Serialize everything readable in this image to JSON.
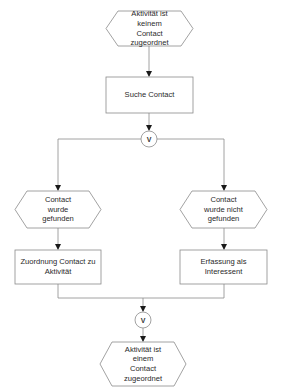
{
  "diagram": {
    "type": "EPC flowchart",
    "colors": {
      "stroke": "#8a8a8a",
      "fill": "#ffffff",
      "text": "#2a2a2a",
      "arrow": "#1a1a1a"
    },
    "nodes": {
      "start_event": {
        "shape": "hexagon",
        "label": "Aktivität ist\nkeinem\nContact\nzugeordnet"
      },
      "search_function": {
        "shape": "rectangle",
        "label": "Suche Contact"
      },
      "split_connector": {
        "shape": "circle",
        "label": "V"
      },
      "found_event": {
        "shape": "hexagon",
        "label": "Contact\nwurde\ngefunden"
      },
      "not_found_event": {
        "shape": "hexagon",
        "label": "Contact\nwurde nicht\ngefunden"
      },
      "assign_function": {
        "shape": "rectangle",
        "label": "Zuordnung Contact zu\nAktivität"
      },
      "register_function": {
        "shape": "rectangle",
        "label": "Erfassung als\nInteressent"
      },
      "join_connector": {
        "shape": "circle",
        "label": "V"
      },
      "end_event": {
        "shape": "hexagon",
        "label": "Aktivität ist\neinem\nContact\nzugeordnet"
      }
    },
    "edges": [
      [
        "start_event",
        "search_function"
      ],
      [
        "search_function",
        "split_connector"
      ],
      [
        "split_connector",
        "found_event"
      ],
      [
        "split_connector",
        "not_found_event"
      ],
      [
        "found_event",
        "assign_function"
      ],
      [
        "not_found_event",
        "register_function"
      ],
      [
        "assign_function",
        "join_connector"
      ],
      [
        "register_function",
        "join_connector"
      ],
      [
        "join_connector",
        "end_event"
      ]
    ]
  }
}
